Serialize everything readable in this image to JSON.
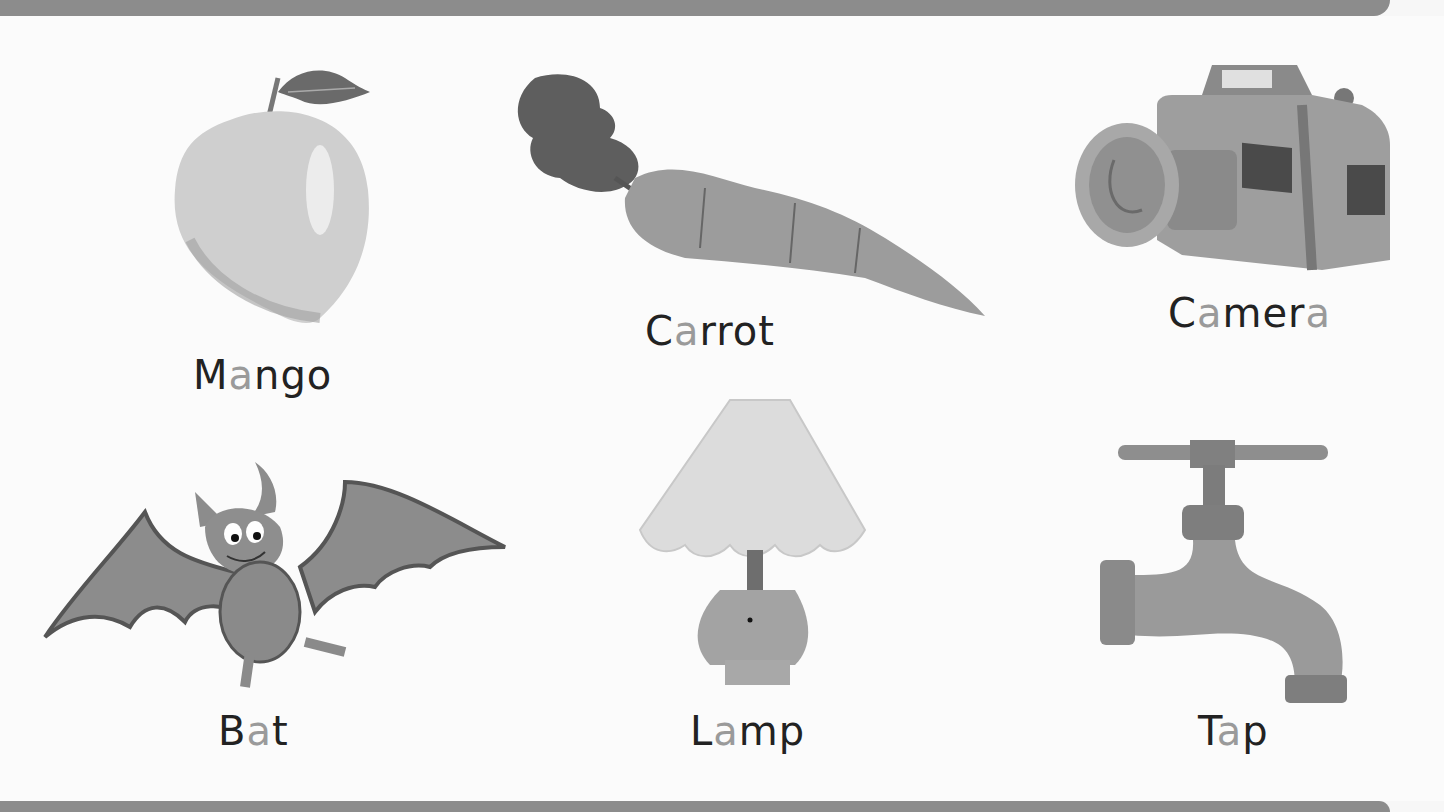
{
  "worksheet": {
    "theme": "Words with the short vowel a",
    "highlight_color": "#9a9a9a",
    "text_color": "#222222",
    "items": [
      {
        "name": "mango",
        "icon": "mango-icon",
        "parts": [
          "M",
          "a",
          "ngo"
        ],
        "label": "Mango"
      },
      {
        "name": "carrot",
        "icon": "carrot-icon",
        "parts": [
          "C",
          "a",
          "rrot"
        ],
        "label": "Carrot"
      },
      {
        "name": "camera",
        "icon": "camera-icon",
        "parts": [
          "C",
          "a",
          "mer",
          "a"
        ],
        "label": "Camera"
      },
      {
        "name": "bat",
        "icon": "bat-icon",
        "parts": [
          "B",
          "a",
          "t"
        ],
        "label": "Bat"
      },
      {
        "name": "lamp",
        "icon": "lamp-icon",
        "parts": [
          "L",
          "a",
          "mp"
        ],
        "label": "Lamp"
      },
      {
        "name": "tap",
        "icon": "tap-icon",
        "parts": [
          "T",
          "a",
          "p"
        ],
        "label": "Tap"
      }
    ]
  }
}
